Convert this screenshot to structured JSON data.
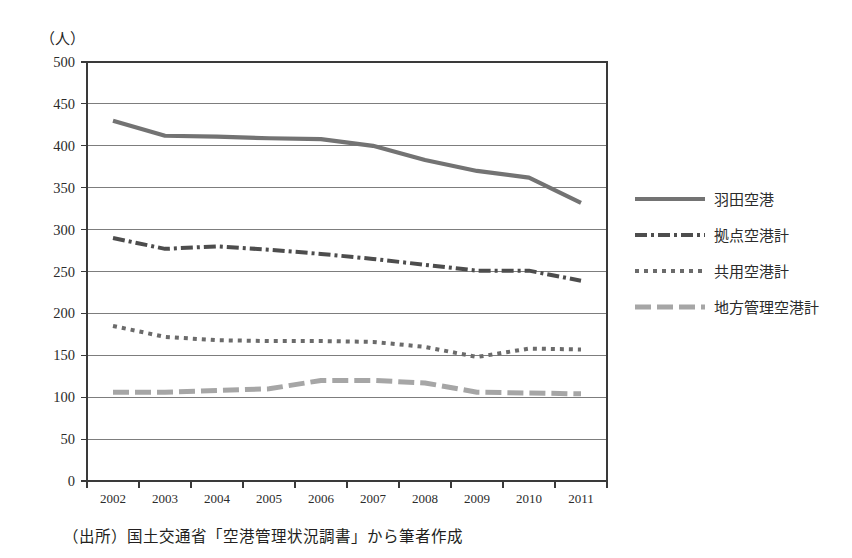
{
  "figure": {
    "unit_label": "（人）",
    "source_note": "（出所）国土交通省「空港管理状況調書」から筆者作成"
  },
  "chart_data": {
    "type": "line",
    "title": "",
    "xlabel": "",
    "ylabel": "（人）",
    "categories": [
      "2002",
      "2003",
      "2004",
      "2005",
      "2006",
      "2007",
      "2008",
      "2009",
      "2010",
      "2011"
    ],
    "x": [
      2002,
      2003,
      2004,
      2005,
      2006,
      2007,
      2008,
      2009,
      2010,
      2011
    ],
    "ylim": [
      0,
      500
    ],
    "ytick_step": 50,
    "yticks": [
      0,
      50,
      100,
      150,
      200,
      250,
      300,
      350,
      400,
      450,
      500
    ],
    "ytick_labels": [
      "0",
      "50",
      "100",
      "150",
      "200",
      "250",
      "300",
      "350",
      "400",
      "450",
      "500"
    ],
    "grid": true,
    "grid_axis": "y",
    "legend_position": "right",
    "series": [
      {
        "name": "羽田空港",
        "style": "solid",
        "color": "#737373",
        "width": 4.2,
        "dash": "",
        "values": [
          430,
          412,
          411,
          409,
          408,
          400,
          383,
          370,
          362,
          332
        ]
      },
      {
        "name": "拠点空港計",
        "style": "dash-dot",
        "color": "#4d4d4d",
        "width": 4.0,
        "dash": "12,4,3,4",
        "values": [
          290,
          277,
          280,
          276,
          271,
          265,
          258,
          251,
          251,
          239
        ]
      },
      {
        "name": "共用空港計",
        "style": "dotted",
        "color": "#6b6b6b",
        "width": 4.0,
        "dash": "4,5",
        "values": [
          185,
          172,
          168,
          167,
          167,
          166,
          160,
          148,
          158,
          157
        ]
      },
      {
        "name": "地方管理空港計",
        "style": "dashed",
        "color": "#a6a6a6",
        "width": 5.0,
        "dash": "16,6",
        "values": [
          106,
          106,
          108,
          110,
          120,
          120,
          117,
          106,
          105,
          104
        ]
      }
    ]
  },
  "legend": {
    "items": [
      {
        "label": "羽田空港"
      },
      {
        "label": "拠点空港計"
      },
      {
        "label": "共用空港計"
      },
      {
        "label": "地方管理空港計"
      }
    ]
  }
}
